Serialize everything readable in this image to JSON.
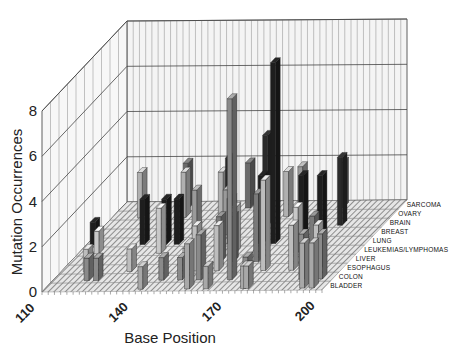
{
  "chart_data": {
    "type": "bar3d",
    "title": "",
    "xlabel": "Base Position",
    "ylabel": "Mutation Occurrences",
    "x_ticks": [
      110,
      140,
      170,
      200
    ],
    "x_range": [
      110,
      200
    ],
    "y_ticks": [
      0,
      2,
      4,
      6,
      8
    ],
    "ylim": [
      0,
      8
    ],
    "grid": true,
    "categories": [
      "BLADDER",
      "COLON",
      "ESOPHAGUS",
      "LIVER",
      "LEUKEMIAS/LYMPHOMAS",
      "LUNG",
      "BREAST",
      "BRAIN",
      "OVARY",
      "SARCOMA"
    ],
    "colors": {
      "BLADDER": "#a8a8a8",
      "COLON": "#8a8a8a",
      "ESOPHAGUS": "#bdbdbd",
      "LIVER": "#7a7a7a",
      "LEUKEMIAS/LYMPHOMAS": "#c8c8c8",
      "LUNG": "#1e1e1e",
      "BREAST": "#9a9a9a",
      "BRAIN": "#2a2a2a",
      "OVARY": "#b0b0b0",
      "SARCOMA": "#6a6a6a"
    },
    "bars": [
      {
        "category": "BLADDER",
        "position": 141,
        "value": 1
      },
      {
        "category": "BLADDER",
        "position": 156,
        "value": 2
      },
      {
        "category": "BLADDER",
        "position": 162,
        "value": 1
      },
      {
        "category": "BLADDER",
        "position": 174,
        "value": 1
      },
      {
        "category": "BLADDER",
        "position": 175,
        "value": 1
      },
      {
        "category": "BLADDER",
        "position": 193,
        "value": 2
      },
      {
        "category": "BLADDER",
        "position": 196,
        "value": 2
      },
      {
        "category": "COLON",
        "position": 121,
        "value": 1
      },
      {
        "category": "COLON",
        "position": 124,
        "value": 1
      },
      {
        "category": "COLON",
        "position": 145,
        "value": 1
      },
      {
        "category": "COLON",
        "position": 151,
        "value": 1
      },
      {
        "category": "COLON",
        "position": 157,
        "value": 2
      },
      {
        "category": "COLON",
        "position": 167,
        "value": 8
      },
      {
        "category": "COLON",
        "position": 172,
        "value": 1
      },
      {
        "category": "COLON",
        "position": 190,
        "value": 2
      },
      {
        "category": "COLON",
        "position": 196,
        "value": 2
      },
      {
        "category": "ESOPHAGUS",
        "position": 118,
        "value": 1
      },
      {
        "category": "ESOPHAGUS",
        "position": 132,
        "value": 1
      },
      {
        "category": "ESOPHAGUS",
        "position": 150,
        "value": 1
      },
      {
        "category": "ESOPHAGUS",
        "position": 153,
        "value": 2
      },
      {
        "category": "ESOPHAGUS",
        "position": 160,
        "value": 2
      },
      {
        "category": "ESOPHAGUS",
        "position": 175,
        "value": 4
      },
      {
        "category": "ESOPHAGUS",
        "position": 184,
        "value": 2
      },
      {
        "category": "ESOPHAGUS",
        "position": 192,
        "value": 2
      },
      {
        "category": "LIVER",
        "position": 150,
        "value": 1
      },
      {
        "category": "LIVER",
        "position": 158,
        "value": 2
      },
      {
        "category": "LIVER",
        "position": 162,
        "value": 2
      },
      {
        "category": "LIVER",
        "position": 170,
        "value": 3
      },
      {
        "category": "LIVER",
        "position": 188,
        "value": 2
      },
      {
        "category": "LEUKEMIAS/LYMPHOMAS",
        "position": 116,
        "value": 1
      },
      {
        "category": "LEUKEMIAS/LYMPHOMAS",
        "position": 136,
        "value": 2
      },
      {
        "category": "LEUKEMIAS/LYMPHOMAS",
        "position": 160,
        "value": 2
      },
      {
        "category": "LEUKEMIAS/LYMPHOMAS",
        "position": 180,
        "value": 2
      },
      {
        "category": "LUNG",
        "position": 112,
        "value": 1
      },
      {
        "category": "LUNG",
        "position": 128,
        "value": 2
      },
      {
        "category": "LUNG",
        "position": 135,
        "value": 2
      },
      {
        "category": "LUNG",
        "position": 139,
        "value": 2
      },
      {
        "category": "LUNG",
        "position": 156,
        "value": 2
      },
      {
        "category": "LUNG",
        "position": 166,
        "value": 3
      },
      {
        "category": "LUNG",
        "position": 170,
        "value": 8
      },
      {
        "category": "LUNG",
        "position": 179,
        "value": 3
      },
      {
        "category": "LUNG",
        "position": 185,
        "value": 3
      },
      {
        "category": "BREAST",
        "position": 142,
        "value": 2
      },
      {
        "category": "BREAST",
        "position": 152,
        "value": 2
      },
      {
        "category": "BREAST",
        "position": 176,
        "value": 3
      },
      {
        "category": "BRAIN",
        "position": 150,
        "value": 3
      },
      {
        "category": "BRAIN",
        "position": 162,
        "value": 4
      },
      {
        "category": "BRAIN",
        "position": 186,
        "value": 3
      },
      {
        "category": "OVARY",
        "position": 119,
        "value": 2
      },
      {
        "category": "OVARY",
        "position": 133,
        "value": 2
      },
      {
        "category": "OVARY",
        "position": 145,
        "value": 2
      },
      {
        "category": "OVARY",
        "position": 166,
        "value": 2
      },
      {
        "category": "SARCOMA",
        "position": 131,
        "value": 2
      },
      {
        "category": "SARCOMA",
        "position": 151,
        "value": 2
      },
      {
        "category": "SARCOMA",
        "position": 181,
        "value": 2
      }
    ],
    "legend_position": "right-depth-axis"
  }
}
